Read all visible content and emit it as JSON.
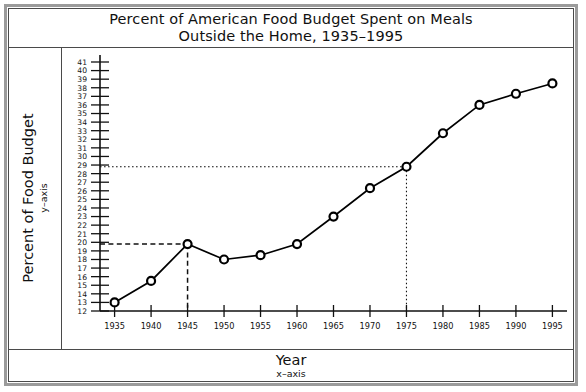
{
  "figure": {
    "title_line1": "Percent of American Food Budget Spent on Meals",
    "title_line2": "Outside the Home, 1935–1995",
    "y_axis_title": "Percent of Food Budget",
    "y_axis_subtitle": "y–axis",
    "x_axis_title": "Year",
    "x_axis_subtitle": "x–axis",
    "line_color": "#000000",
    "marker_fill": "#ffffff",
    "frame_color": "#4a4a4a"
  },
  "chart_data": {
    "type": "line",
    "title": "Percent of American Food Budget Spent on Meals Outside the Home, 1935–1995",
    "xlabel": "Year",
    "ylabel": "Percent of Food Budget",
    "x": [
      1935,
      1940,
      1945,
      1950,
      1955,
      1960,
      1965,
      1970,
      1975,
      1980,
      1985,
      1990,
      1995
    ],
    "values": [
      13.0,
      15.5,
      19.8,
      18.0,
      18.5,
      19.8,
      23.0,
      26.3,
      28.8,
      32.7,
      36.0,
      37.3,
      38.5
    ],
    "xlim": [
      1933,
      1997
    ],
    "ylim": [
      12,
      41
    ],
    "xticks": [
      1935,
      1940,
      1945,
      1950,
      1955,
      1960,
      1965,
      1970,
      1975,
      1980,
      1985,
      1990,
      1995
    ],
    "xtick_labels": [
      "1935",
      "1940",
      "1945",
      "1950",
      "1955",
      "1960",
      "1965",
      "1970",
      "1975",
      "1980",
      "1985",
      "1990",
      "1995"
    ],
    "yticks": [
      12,
      13,
      14,
      15,
      16,
      17,
      18,
      19,
      20,
      21,
      22,
      23,
      24,
      25,
      26,
      27,
      28,
      29,
      30,
      31,
      32,
      33,
      34,
      35,
      36,
      37,
      38,
      39,
      40,
      41
    ],
    "ytick_labels": [
      "12",
      "13",
      "14",
      "15",
      "16",
      "17",
      "18",
      "19",
      "20",
      "21",
      "22",
      "23",
      "24",
      "25",
      "26",
      "27",
      "28",
      "29",
      "30",
      "31",
      "32",
      "33",
      "34",
      "35",
      "36",
      "37",
      "38",
      "39",
      "40",
      "41"
    ],
    "grid": false,
    "legend": null,
    "markers": "open-circle",
    "annotations": [
      {
        "name": "guide-1945",
        "style": "dashed",
        "x": 1945,
        "y": 19.8,
        "label": ""
      },
      {
        "name": "guide-1975",
        "style": "dotted",
        "x": 1975,
        "y": 28.8,
        "label": ""
      }
    ]
  }
}
